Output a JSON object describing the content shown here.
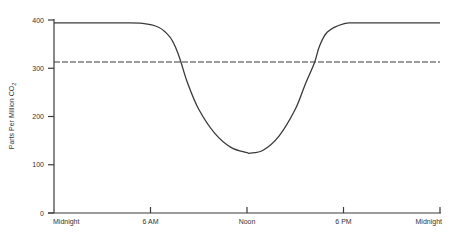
{
  "chart_data": {
    "type": "line",
    "title": "",
    "xlabel": "",
    "ylabel": "Parts Per Million CO",
    "ylabel_subscript": "2",
    "ylim": [
      0,
      400
    ],
    "xlim": [
      0,
      24
    ],
    "grid": false,
    "legend": null,
    "y_ticks": [
      {
        "value": 0,
        "label": "0"
      },
      {
        "value": 100,
        "label": "100"
      },
      {
        "value": 200,
        "label": "200"
      },
      {
        "value": 300,
        "label": "300"
      },
      {
        "value": 400,
        "label": "400"
      }
    ],
    "x_ticks": [
      {
        "value": 0,
        "label": "Midnight"
      },
      {
        "value": 6,
        "label": "6 AM"
      },
      {
        "value": 12,
        "label": "Noon"
      },
      {
        "value": 18,
        "label": "6 PM"
      },
      {
        "value": 24,
        "label": "Midnight"
      }
    ],
    "series": [
      {
        "name": "Diurnal CO2 concentration",
        "style": "solid",
        "color": "#3a3a3a",
        "x": [
          0,
          4,
          5.5,
          6.5,
          7.2,
          7.6,
          7.9,
          8.3,
          9,
          10,
          11,
          12,
          12.2,
          13,
          14,
          15,
          15.6,
          16.2,
          16.5,
          17,
          18,
          19,
          24
        ],
        "y": [
          394,
          394,
          393,
          385,
          365,
          340,
          312,
          270,
          215,
          165,
          136,
          125,
          124,
          130,
          160,
          215,
          265,
          312,
          345,
          375,
          392,
          394,
          394
        ]
      },
      {
        "name": "Reference level",
        "style": "dashed",
        "color": "#3a3a3a",
        "x": [
          0,
          24
        ],
        "y": [
          313,
          313
        ]
      }
    ]
  }
}
